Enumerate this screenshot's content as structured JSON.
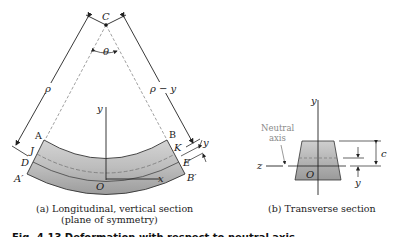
{
  "figure": {
    "panel_a": {
      "caption_line1": "(a) Longitudinal, vertical section",
      "caption_line2": "(plane of symmetry)",
      "labels": {
        "center": "C",
        "angle": "θ",
        "radius": "ρ",
        "radius_minus_y": "ρ − y",
        "y_axis": "y",
        "x_axis": "x",
        "origin": "O",
        "A": "A",
        "B": "B",
        "J": "J",
        "K": "K",
        "D": "D",
        "E": "E",
        "A_prime": "A′",
        "B_prime": "B′",
        "y_offset": "y"
      }
    },
    "panel_b": {
      "caption": "(b) Transverse section",
      "labels": {
        "neutral_axis_line1": "Neutral",
        "neutral_axis_line2": "axis",
        "y_axis": "y",
        "z_axis": "z",
        "origin": "O",
        "c_dim": "c",
        "y_dim": "y"
      }
    },
    "figure_caption": "Fig. 4.13   Deformation with respect to neutral axis."
  },
  "colors": {
    "beam_fill_top": "#c9c9c9",
    "beam_fill_bottom": "#9a9a9a",
    "line": "#222222",
    "dashed": "#888888"
  }
}
